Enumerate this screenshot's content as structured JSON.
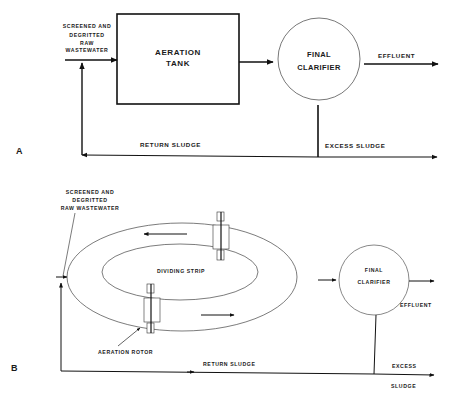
{
  "diagram_a": {
    "panel_label": "A",
    "influent_label_lines": [
      "SCREENED AND",
      "DEGRITTED",
      "RAW",
      "WASTEWATER"
    ],
    "tank_label_lines": [
      "AERATION",
      "TANK"
    ],
    "clarifier_label_lines": [
      "FINAL",
      "CLARIFIER"
    ],
    "effluent_label": "EFFLUENT",
    "return_sludge_label": "RETURN SLUDGE",
    "excess_sludge_label": "EXCESS SLUDGE"
  },
  "diagram_b": {
    "panel_label": "B",
    "influent_label_lines": [
      "SCREENED AND",
      "DEGRITTED",
      "RAW WASTEWATER"
    ],
    "dividing_strip_label": "DIVIDING STRIP",
    "aeration_rotor_label": "AERATION ROTOR",
    "clarifier_label_lines": [
      "FINAL",
      "CLARIFIER"
    ],
    "effluent_label": "EFFLUENT",
    "return_sludge_label": "RETURN SLUDGE",
    "excess_sludge_label_lines": [
      "EXCESS",
      "SLUDGE"
    ]
  }
}
